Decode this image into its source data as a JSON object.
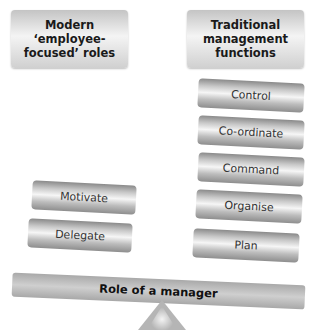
{
  "diagram": {
    "left_header": "Modern ‘employee-focused’ roles",
    "right_header": "Traditional management functions",
    "left_blocks": [
      "Motivate",
      "Delegate"
    ],
    "right_blocks": [
      "Control",
      "Co-ordinate",
      "Command",
      "Organise",
      "Plan"
    ],
    "beam_label": "Role of a manager",
    "colors": {
      "block_dark": "#8a8a8a",
      "block_light": "#f6f6f6",
      "beam": "#b8b8b8",
      "fulcrum": "#b5b5b5",
      "text": "#333333"
    }
  }
}
